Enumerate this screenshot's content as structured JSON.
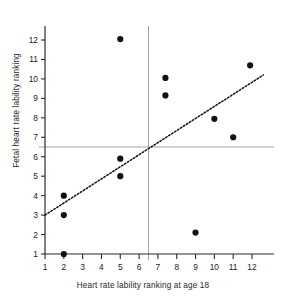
{
  "chart_data": {
    "type": "scatter",
    "title": "",
    "xlabel": "Heart rate lability ranking at age 18",
    "ylabel": "Fetal heart rate lability ranking",
    "xlim": [
      1,
      12.9
    ],
    "ylim": [
      1,
      12.6
    ],
    "xticks": [
      1,
      2,
      3,
      4,
      5,
      6,
      7,
      8,
      9,
      10,
      11,
      12
    ],
    "yticks": [
      1,
      2,
      3,
      4,
      5,
      6,
      7,
      8,
      9,
      10,
      11,
      12
    ],
    "xtick_labels": [
      "1",
      "2",
      "3",
      "4",
      "5",
      "6",
      "7",
      "8",
      "9",
      "10",
      "11",
      "12"
    ],
    "ytick_labels": [
      "1",
      "2",
      "3",
      "4",
      "5",
      "6",
      "7",
      "8",
      "9",
      "10",
      "11",
      "12"
    ],
    "grid": false,
    "points": [
      {
        "x": 2.0,
        "y": 1.0
      },
      {
        "x": 2.0,
        "y": 3.0
      },
      {
        "x": 2.0,
        "y": 4.0
      },
      {
        "x": 5.0,
        "y": 5.0
      },
      {
        "x": 5.0,
        "y": 5.9
      },
      {
        "x": 5.0,
        "y": 12.05
      },
      {
        "x": 7.4,
        "y": 9.15
      },
      {
        "x": 7.4,
        "y": 10.05
      },
      {
        "x": 9.0,
        "y": 2.1
      },
      {
        "x": 10.0,
        "y": 7.95
      },
      {
        "x": 11.0,
        "y": 7.0
      },
      {
        "x": 11.9,
        "y": 10.7
      }
    ],
    "marker": {
      "shape": "circle",
      "size": 5,
      "color": "#111111"
    },
    "fit_line": {
      "style": "dotted",
      "color": "#111111",
      "x0": 1.0,
      "y0": 3.0,
      "x1": 12.6,
      "y1": 10.2
    },
    "reference_lines": [
      {
        "orientation": "horizontal",
        "value": 6.5,
        "color": "#9a9a9a"
      },
      {
        "orientation": "vertical",
        "value": 6.5,
        "color": "#9a9a9a"
      }
    ],
    "axis_color": "#2a2a2a"
  }
}
